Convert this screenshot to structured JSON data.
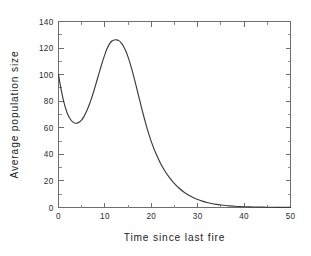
{
  "chart_data": {
    "type": "line",
    "title": "",
    "subtitle": "",
    "xlabel": "Time since last fire",
    "ylabel": "Average population size",
    "xlim": [
      0,
      50
    ],
    "ylim": [
      0,
      140
    ],
    "xticks": [
      0,
      10,
      20,
      30,
      40,
      50
    ],
    "yticks": [
      0,
      20,
      40,
      60,
      80,
      100,
      120,
      140
    ],
    "xtick_labels": [
      "0",
      "10",
      "20",
      "30",
      "40",
      "50"
    ],
    "ytick_labels": [
      "0",
      "20",
      "40",
      "60",
      "80",
      "100",
      "120",
      "140"
    ],
    "x_minor_interval": 5,
    "y_minor_interval": 10,
    "grid": false,
    "legend": false,
    "legend_position": "none",
    "frame": "box",
    "tick_direction": "in",
    "series": [
      {
        "name": "Average population size",
        "color": "#3a3a3a",
        "x": [
          0,
          0.5,
          1,
          1.5,
          2,
          2.5,
          3,
          3.5,
          4,
          4.5,
          5,
          5.5,
          6,
          6.5,
          7,
          7.5,
          8,
          8.5,
          9,
          9.5,
          10,
          10.5,
          11,
          11.5,
          12,
          12.5,
          13,
          13.5,
          14,
          14.5,
          15,
          15.5,
          16,
          16.5,
          17,
          17.5,
          18,
          18.5,
          19,
          19.5,
          20,
          21,
          22,
          23,
          24,
          25,
          26,
          27,
          28,
          29,
          30,
          31,
          32,
          33,
          34,
          35,
          36,
          37,
          38,
          39,
          40,
          42,
          44,
          46,
          48,
          50
        ],
        "y": [
          100,
          90,
          81.5,
          75,
          70,
          66.8,
          64.6,
          63.6,
          63.5,
          64.3,
          66,
          68.6,
          72,
          76.2,
          81,
          86.4,
          92.2,
          98.2,
          104.2,
          110,
          115.3,
          119.8,
          123.2,
          125.3,
          126.1,
          126.2,
          125.6,
          124,
          121.4,
          117.8,
          113.2,
          107.7,
          101.5,
          94.8,
          87.8,
          80.7,
          73.7,
          67,
          60.7,
          54.9,
          49.6,
          40.6,
          33.2,
          27.1,
          22.1,
          17.9,
          14.5,
          11.7,
          9.4,
          7.5,
          6,
          4.8,
          3.8,
          3,
          2.4,
          1.9,
          1.5,
          1.2,
          0.95,
          0.75,
          0.6,
          0.38,
          0.24,
          0.15,
          0.1,
          0.06
        ],
        "peak_x": 12.6,
        "peak_y": 126,
        "local_min_x": 4,
        "local_min_y": 63.5,
        "start_x": 0,
        "start_y": 100
      }
    ]
  },
  "colors": {
    "background": "#ffffff",
    "axis": "#6e6e6e",
    "curve": "#3a3a3a",
    "text": "#1d1d1d"
  }
}
